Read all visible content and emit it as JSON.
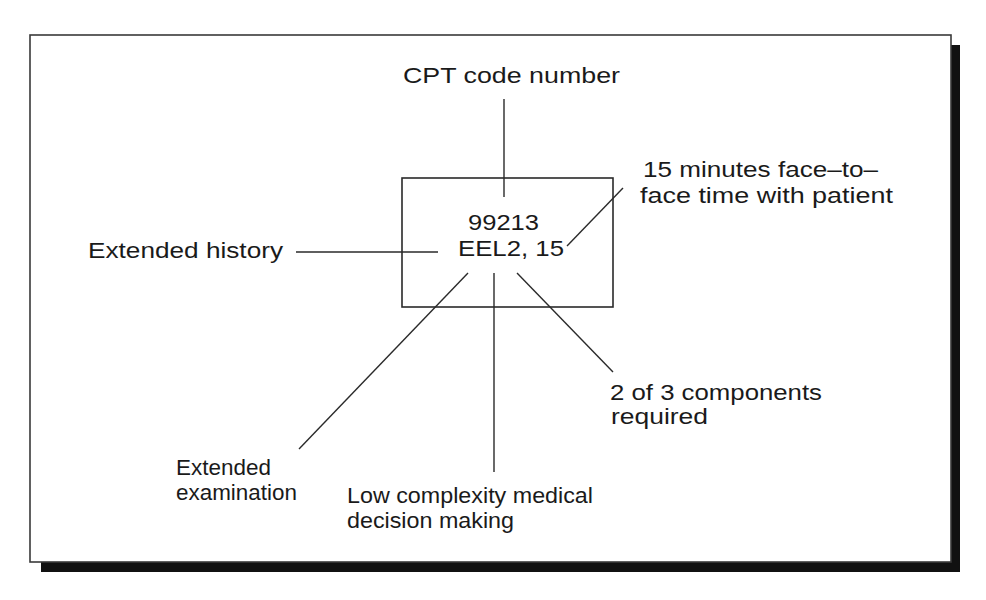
{
  "diagram": {
    "title_label": "CPT code number",
    "code_box": {
      "code": "99213",
      "descriptor": "EEL2, 15"
    },
    "labels": {
      "extended_history": "Extended history",
      "face_time": {
        "line1": "15 minutes face–to–",
        "line2": "face time with patient"
      },
      "components": {
        "line1": "2 of 3 components",
        "line2": "required"
      },
      "extended_examination": {
        "line1": "Extended",
        "line2": "examination"
      },
      "decision_making": {
        "line1": "Low complexity medical",
        "line2": "decision making"
      }
    },
    "colors": {
      "ink": "#1a1a1a",
      "frame_shadow": "#111111",
      "background": "#ffffff"
    }
  }
}
